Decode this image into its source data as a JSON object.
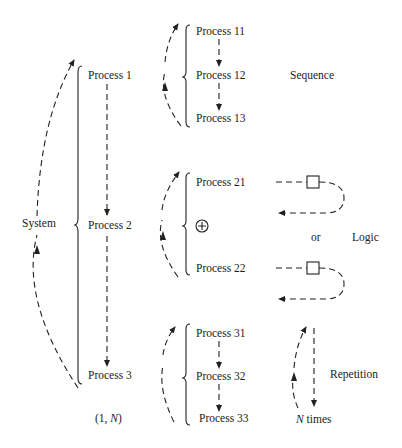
{
  "system": {
    "label": "System",
    "processes": [
      "Process 1",
      "Process 2",
      "Process 3"
    ],
    "cardinality": "(1, N)"
  },
  "sequence": {
    "label": "Sequence",
    "processes": [
      "Process 11",
      "Process 12",
      "Process 13"
    ]
  },
  "logic": {
    "label": "Logic",
    "or_label": "or",
    "operator_symbol": "+",
    "processes": [
      "Process 21",
      "Process 22"
    ]
  },
  "repetition": {
    "label": "Repetition",
    "times_label": "N times",
    "processes": [
      "Process 31",
      "Process 32",
      "Process 33"
    ]
  }
}
